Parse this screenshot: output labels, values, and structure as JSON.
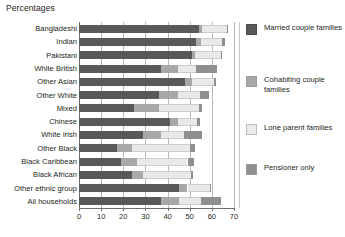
{
  "chart_data": {
    "type": "bar",
    "subtype": "horizontal-stacked",
    "title": "Percentages",
    "xlabel": "",
    "ylabel": "",
    "xlim": [
      0,
      70
    ],
    "xticks": [
      0,
      10,
      20,
      30,
      40,
      50,
      60,
      70
    ],
    "grid": true,
    "legend_position": "right",
    "categories": [
      "Bangladeshi",
      "Indian",
      "Pakistani",
      "White British",
      "Other Asian",
      "Other White",
      "Mixed",
      "Chinese",
      "White Irish",
      "Other Black",
      "Black Caribbean",
      "Black African",
      "Other ethnic group",
      "All households"
    ],
    "series": [
      {
        "name": "Married couple families",
        "color": "#595959",
        "values": [
          54,
          53,
          51,
          37,
          48,
          36,
          25,
          41,
          29,
          17,
          19,
          24,
          45,
          37
        ]
      },
      {
        "name": "Cohabiting couple families",
        "color": "#a8a8a8",
        "values": [
          1.5,
          2,
          1.5,
          7.5,
          3,
          8.5,
          11,
          3.5,
          8,
          7,
          7,
          5,
          4,
          8
        ]
      },
      {
        "name": "Lone parent families",
        "color": "#e9e9e9",
        "values": [
          11.5,
          9.5,
          11.5,
          8.5,
          10,
          10,
          18,
          9,
          10.5,
          26,
          23,
          21.5,
          10,
          10
        ]
      },
      {
        "name": "Pensioner only",
        "color": "#8f8f8f",
        "values": [
          0.5,
          1.5,
          0.5,
          9.5,
          1,
          4,
          1.5,
          1,
          8,
          2.5,
          3,
          1,
          0.5,
          9
        ]
      }
    ]
  },
  "legend": {
    "items": [
      {
        "label": "Married couple families",
        "swatch": "married"
      },
      {
        "label": "Cohabiting couple families",
        "swatch": "cohab"
      },
      {
        "label": "Lone parent families",
        "swatch": "lone"
      },
      {
        "label": "Pensioner only",
        "swatch": "pension"
      }
    ]
  }
}
